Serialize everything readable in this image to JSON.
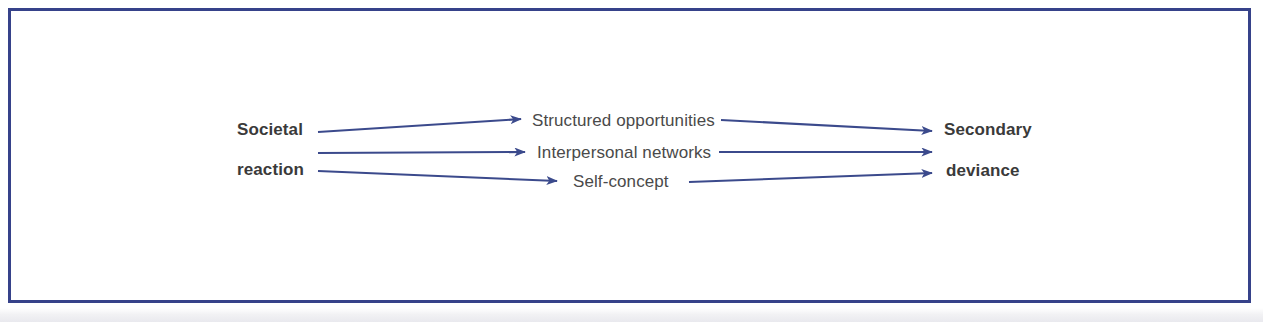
{
  "figure": {
    "kind": "flow-diagram",
    "orientation": "left-to-right",
    "frame_color": "#36428a",
    "arrow_color": "#3b4a8c",
    "bold_text_color": "#3a3a3a",
    "plain_text_color": "#4a4a4a",
    "background_color": "#ffffff"
  },
  "nodes": {
    "source": {
      "id": "societal-reaction",
      "line1": "Societal",
      "line2": "reaction",
      "emphasis": "bold"
    },
    "mediators": [
      {
        "id": "structured-opportunities",
        "label": "Structured opportunities",
        "emphasis": "plain"
      },
      {
        "id": "interpersonal-networks",
        "label": "Interpersonal networks",
        "emphasis": "plain"
      },
      {
        "id": "self-concept",
        "label": "Self-concept",
        "emphasis": "plain"
      }
    ],
    "outcome": {
      "id": "secondary-deviance",
      "line1": "Secondary",
      "line2": "deviance",
      "emphasis": "bold"
    }
  },
  "edges": [
    {
      "id": "edge-source-to-structured-opportunities",
      "from": "societal-reaction",
      "to": "structured-opportunities"
    },
    {
      "id": "edge-source-to-interpersonal-networks",
      "from": "societal-reaction",
      "to": "interpersonal-networks"
    },
    {
      "id": "edge-source-to-self-concept",
      "from": "societal-reaction",
      "to": "self-concept"
    },
    {
      "id": "edge-structured-opportunities-to-outcome",
      "from": "structured-opportunities",
      "to": "secondary-deviance"
    },
    {
      "id": "edge-interpersonal-networks-to-outcome",
      "from": "interpersonal-networks",
      "to": "secondary-deviance"
    },
    {
      "id": "edge-self-concept-to-outcome",
      "from": "self-concept",
      "to": "secondary-deviance"
    }
  ]
}
